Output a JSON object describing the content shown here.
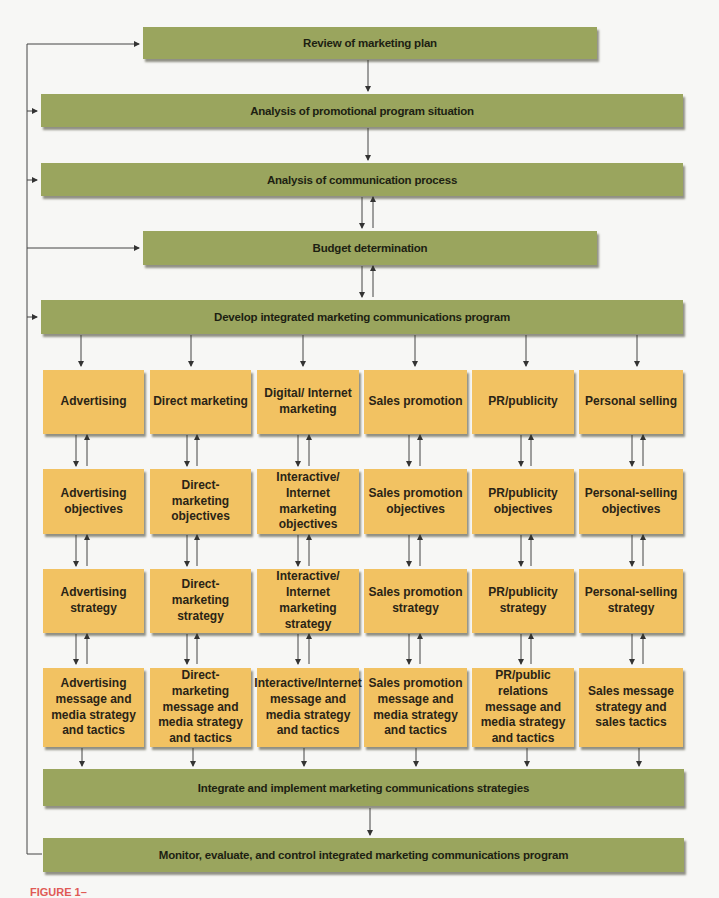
{
  "diagram": {
    "top_steps": [
      {
        "label": "Review of marketing plan"
      },
      {
        "label": "Analysis of promotional program situation"
      },
      {
        "label": "Analysis of communication process"
      },
      {
        "label": "Budget determination"
      },
      {
        "label": "Develop integrated marketing communications program"
      }
    ],
    "columns": [
      {
        "element": "Advertising",
        "objectives": "Advertising objectives",
        "strategy": "Advertising strategy",
        "tactics": "Advertising message and media strategy and tactics"
      },
      {
        "element": "Direct marketing",
        "objectives": "Direct-marketing objectives",
        "strategy": "Direct-marketing strategy",
        "tactics": "Direct-marketing message and media strategy and tactics"
      },
      {
        "element": "Digital/ Internet marketing",
        "objectives": "Interactive/ Internet marketing objectives",
        "strategy": "Interactive/ Internet marketing strategy",
        "tactics": "Interactive/Internet message and media strategy and tactics"
      },
      {
        "element": "Sales promotion",
        "objectives": "Sales promotion objectives",
        "strategy": "Sales promotion strategy",
        "tactics": "Sales promotion message and media strategy and tactics"
      },
      {
        "element": "PR/publicity",
        "objectives": "PR/publicity objectives",
        "strategy": "PR/publicity strategy",
        "tactics": "PR/public relations message and media strategy and tactics"
      },
      {
        "element": "Personal selling",
        "objectives": "Personal-selling objectives",
        "strategy": "Personal-selling strategy",
        "tactics": "Sales message strategy and sales tactics"
      }
    ],
    "bottom_steps": [
      {
        "label": "Integrate and implement marketing communications strategies"
      },
      {
        "label": "Monitor, evaluate, and control integrated marketing communications program"
      }
    ],
    "colors": {
      "green": "#9aa55e",
      "yellow": "#f2c262",
      "line": "#333333"
    }
  },
  "caption": {
    "text": "FIGURE 1–"
  }
}
